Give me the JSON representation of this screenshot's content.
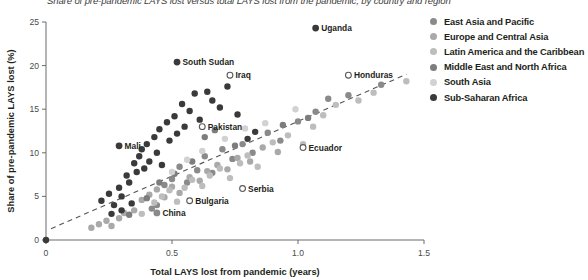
{
  "chart_data": {
    "type": "scatter",
    "title": "Share of pre-pandemic LAYS lost versus total LAYS lost from the pandemic, by country and region",
    "xlabel": "Total LAYS lost from pandemic (years)",
    "ylabel": "Share of pre-pandemic LAYS lost (%)",
    "xlim": [
      0,
      1.5
    ],
    "ylim": [
      0,
      25
    ],
    "xticks": [
      "0",
      "0.5",
      "1.0",
      "1.5"
    ],
    "xtick_values": [
      0,
      0.5,
      1.0,
      1.5
    ],
    "yticks": [
      "0",
      "5",
      "10",
      "15",
      "20",
      "25"
    ],
    "ytick_values": [
      0,
      5,
      10,
      15,
      20,
      25
    ],
    "grid": false,
    "legend_position": "right",
    "trendline": {
      "type": "dashed",
      "x0": 0.02,
      "y0": 1.3,
      "x1": 1.43,
      "y1": 19.0
    },
    "legend": [
      {
        "name": "East Asia and Pacific",
        "color": "#8a8a8a"
      },
      {
        "name": "Europe and Central Asia",
        "color": "#a9a9a9"
      },
      {
        "name": "Latin America and the Caribbean",
        "color": "#bdbdbd"
      },
      {
        "name": "Middle East and North Africa",
        "color": "#7d7d7d"
      },
      {
        "name": "South Asia",
        "color": "#d2d2d2"
      },
      {
        "name": "Sub-Saharan Africa",
        "color": "#3a3a3a"
      }
    ],
    "series": [
      {
        "name": "East Asia and Pacific",
        "color": "#8a8a8a",
        "points": [
          {
            "x": 0.42,
            "y": 3.6
          },
          {
            "x": 0.44,
            "y": 4.0
          },
          {
            "x": 0.47,
            "y": 6.3
          },
          {
            "x": 0.5,
            "y": 7.0
          },
          {
            "x": 0.53,
            "y": 8.4
          },
          {
            "x": 0.56,
            "y": 6.6
          },
          {
            "x": 0.6,
            "y": 8.0
          },
          {
            "x": 0.63,
            "y": 9.6
          },
          {
            "x": 0.66,
            "y": 7.7
          },
          {
            "x": 0.7,
            "y": 10.4
          },
          {
            "x": 0.74,
            "y": 9.3
          },
          {
            "x": 0.78,
            "y": 11.0
          },
          {
            "x": 0.82,
            "y": 10.0
          },
          {
            "x": 0.88,
            "y": 12.3
          },
          {
            "x": 0.93,
            "y": 11.4
          },
          {
            "x": 1.0,
            "y": 13.6
          },
          {
            "x": 1.07,
            "y": 14.7
          },
          {
            "x": 1.12,
            "y": 16.2
          },
          {
            "x": 1.2,
            "y": 16.6
          },
          {
            "x": 1.33,
            "y": 17.8
          }
        ]
      },
      {
        "name": "Europe and Central Asia",
        "color": "#a9a9a9",
        "points": [
          {
            "x": 0.18,
            "y": 1.4
          },
          {
            "x": 0.21,
            "y": 1.8
          },
          {
            "x": 0.24,
            "y": 2.2
          },
          {
            "x": 0.26,
            "y": 1.6
          },
          {
            "x": 0.29,
            "y": 2.5
          },
          {
            "x": 0.31,
            "y": 3.1
          },
          {
            "x": 0.35,
            "y": 3.4
          },
          {
            "x": 0.38,
            "y": 4.6
          },
          {
            "x": 0.41,
            "y": 5.2
          },
          {
            "x": 0.44,
            "y": 5.8
          },
          {
            "x": 0.47,
            "y": 4.9
          },
          {
            "x": 0.5,
            "y": 6.1
          },
          {
            "x": 0.53,
            "y": 5.4
          },
          {
            "x": 0.57,
            "y": 7.2
          },
          {
            "x": 0.61,
            "y": 6.8
          },
          {
            "x": 0.64,
            "y": 7.9
          },
          {
            "x": 0.68,
            "y": 8.6
          },
          {
            "x": 0.72,
            "y": 8.1
          },
          {
            "x": 0.76,
            "y": 9.4
          },
          {
            "x": 0.81,
            "y": 9.0
          },
          {
            "x": 0.86,
            "y": 10.6
          },
          {
            "x": 0.92,
            "y": 10.1
          }
        ]
      },
      {
        "name": "Latin America and the Caribbean",
        "color": "#bdbdbd",
        "points": [
          {
            "x": 0.38,
            "y": 3.0
          },
          {
            "x": 0.43,
            "y": 4.3
          },
          {
            "x": 0.46,
            "y": 5.0
          },
          {
            "x": 0.49,
            "y": 5.7
          },
          {
            "x": 0.52,
            "y": 4.4
          },
          {
            "x": 0.55,
            "y": 6.0
          },
          {
            "x": 0.58,
            "y": 6.9
          },
          {
            "x": 0.62,
            "y": 6.2
          },
          {
            "x": 0.65,
            "y": 7.4
          },
          {
            "x": 0.69,
            "y": 8.2
          },
          {
            "x": 0.73,
            "y": 7.1
          },
          {
            "x": 0.77,
            "y": 8.8
          },
          {
            "x": 0.8,
            "y": 9.7
          },
          {
            "x": 0.84,
            "y": 8.4
          },
          {
            "x": 0.9,
            "y": 11.2
          },
          {
            "x": 0.96,
            "y": 12.0
          },
          {
            "x": 1.02,
            "y": 11.0
          },
          {
            "x": 1.06,
            "y": 13.0
          },
          {
            "x": 1.1,
            "y": 14.3
          },
          {
            "x": 1.15,
            "y": 15.5
          },
          {
            "x": 1.24,
            "y": 16.0
          },
          {
            "x": 1.3,
            "y": 16.9
          },
          {
            "x": 1.43,
            "y": 18.2
          }
        ]
      },
      {
        "name": "Middle East and North Africa",
        "color": "#7d7d7d",
        "points": [
          {
            "x": 0.33,
            "y": 2.9
          },
          {
            "x": 0.4,
            "y": 4.8
          },
          {
            "x": 0.45,
            "y": 6.6
          },
          {
            "x": 0.51,
            "y": 7.6
          },
          {
            "x": 0.58,
            "y": 9.0
          },
          {
            "x": 0.63,
            "y": 11.8
          },
          {
            "x": 0.67,
            "y": 12.6
          },
          {
            "x": 0.75,
            "y": 10.8
          },
          {
            "x": 0.94,
            "y": 13.2
          },
          {
            "x": 1.04,
            "y": 14.0
          }
        ]
      },
      {
        "name": "South Asia",
        "color": "#d2d2d2",
        "points": [
          {
            "x": 0.5,
            "y": 7.8
          },
          {
            "x": 0.56,
            "y": 9.2
          },
          {
            "x": 0.62,
            "y": 10.2
          },
          {
            "x": 0.71,
            "y": 11.6
          },
          {
            "x": 0.79,
            "y": 12.8
          },
          {
            "x": 0.87,
            "y": 13.4
          },
          {
            "x": 0.99,
            "y": 15.0
          }
        ]
      },
      {
        "name": "Sub-Saharan Africa",
        "color": "#3a3a3a",
        "points": [
          {
            "x": 0.0,
            "y": 0.0
          },
          {
            "x": 0.22,
            "y": 4.5
          },
          {
            "x": 0.25,
            "y": 5.3
          },
          {
            "x": 0.27,
            "y": 4.0
          },
          {
            "x": 0.29,
            "y": 6.0
          },
          {
            "x": 0.3,
            "y": 5.0
          },
          {
            "x": 0.32,
            "y": 7.4
          },
          {
            "x": 0.33,
            "y": 6.6
          },
          {
            "x": 0.35,
            "y": 8.8
          },
          {
            "x": 0.36,
            "y": 7.8
          },
          {
            "x": 0.37,
            "y": 9.6
          },
          {
            "x": 0.38,
            "y": 10.4
          },
          {
            "x": 0.39,
            "y": 8.2
          },
          {
            "x": 0.4,
            "y": 11.0
          },
          {
            "x": 0.41,
            "y": 9.0
          },
          {
            "x": 0.43,
            "y": 11.8
          },
          {
            "x": 0.44,
            "y": 10.0
          },
          {
            "x": 0.45,
            "y": 12.7
          },
          {
            "x": 0.46,
            "y": 8.6
          },
          {
            "x": 0.48,
            "y": 13.5
          },
          {
            "x": 0.49,
            "y": 11.4
          },
          {
            "x": 0.51,
            "y": 14.2
          },
          {
            "x": 0.52,
            "y": 12.2
          },
          {
            "x": 0.54,
            "y": 15.6
          },
          {
            "x": 0.55,
            "y": 13.0
          },
          {
            "x": 0.57,
            "y": 14.8
          },
          {
            "x": 0.59,
            "y": 16.8
          },
          {
            "x": 0.61,
            "y": 13.8
          },
          {
            "x": 0.64,
            "y": 17.0
          },
          {
            "x": 0.66,
            "y": 16.0
          },
          {
            "x": 0.69,
            "y": 15.2
          },
          {
            "x": 0.72,
            "y": 17.6
          },
          {
            "x": 0.76,
            "y": 14.4
          },
          {
            "x": 0.8,
            "y": 11.6
          },
          {
            "x": 0.83,
            "y": 12.4
          },
          {
            "x": 0.3,
            "y": 3.4
          },
          {
            "x": 0.26,
            "y": 3.0
          },
          {
            "x": 0.34,
            "y": 4.2
          }
        ]
      }
    ],
    "annotations": [
      {
        "label": "Uganda",
        "x": 1.07,
        "y": 24.3,
        "color": "#3a3a3a",
        "filled": true,
        "side": "right"
      },
      {
        "label": "South Sudan",
        "x": 0.52,
        "y": 20.4,
        "color": "#3a3a3a",
        "filled": true,
        "side": "right"
      },
      {
        "label": "Iraq",
        "x": 0.73,
        "y": 18.9,
        "color": "#7d7d7d",
        "filled": false,
        "side": "right"
      },
      {
        "label": "Honduras",
        "x": 1.2,
        "y": 18.9,
        "color": "#bdbdbd",
        "filled": false,
        "side": "right"
      },
      {
        "label": "Pakistan",
        "x": 0.62,
        "y": 13.0,
        "color": "#d2d2d2",
        "filled": false,
        "side": "right"
      },
      {
        "label": "Ecuador",
        "x": 1.02,
        "y": 10.6,
        "color": "#bdbdbd",
        "filled": false,
        "side": "right"
      },
      {
        "label": "Mali",
        "x": 0.29,
        "y": 10.8,
        "color": "#3a3a3a",
        "filled": true,
        "side": "right"
      },
      {
        "label": "Serbia",
        "x": 0.78,
        "y": 5.9,
        "color": "#a9a9a9",
        "filled": false,
        "side": "right"
      },
      {
        "label": "Bulgaria",
        "x": 0.57,
        "y": 4.5,
        "color": "#a9a9a9",
        "filled": false,
        "side": "right"
      },
      {
        "label": "China",
        "x": 0.44,
        "y": 3.1,
        "color": "#8a8a8a",
        "filled": true,
        "side": "right"
      }
    ]
  }
}
